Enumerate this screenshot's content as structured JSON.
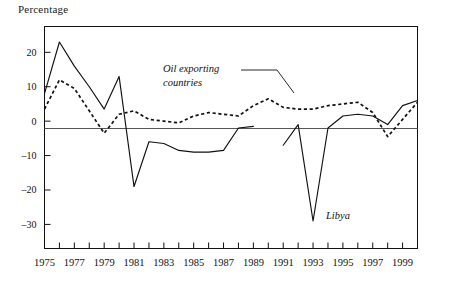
{
  "chart_data": {
    "type": "line",
    "title": "",
    "ylabel": "Percentage",
    "xlabel": "",
    "ylim": [
      -37,
      27.5
    ],
    "xlim": [
      1975,
      2000
    ],
    "grid": false,
    "zero_line": true,
    "legend_position": "inline-annotations",
    "y_ticks": [
      20,
      10,
      0,
      -10,
      -20,
      -30
    ],
    "y_tick_labels": [
      "20",
      "10",
      "0",
      "–10",
      "–20",
      "–30"
    ],
    "x_ticks": [
      1975,
      1976,
      1977,
      1978,
      1979,
      1980,
      1981,
      1982,
      1983,
      1984,
      1985,
      1986,
      1987,
      1988,
      1989,
      1990,
      1991,
      1992,
      1993,
      1994,
      1995,
      1996,
      1997,
      1998,
      1999,
      2000
    ],
    "x_tick_labels_shown": [
      "1975",
      "1977",
      "1979",
      "1981",
      "1983",
      "1985",
      "1987",
      "1989",
      "1991",
      "1993",
      "1995",
      "1997",
      "1999"
    ],
    "x": [
      1975,
      1976,
      1977,
      1978,
      1979,
      1980,
      1981,
      1982,
      1983,
      1984,
      1985,
      1986,
      1987,
      1988,
      1989,
      1990,
      1991,
      1992,
      1993,
      1994,
      1995,
      1996,
      1997,
      1998,
      1999,
      2000
    ],
    "series": [
      {
        "name": "Libya",
        "style": "solid",
        "color": "#111111",
        "annotation": "Libya",
        "has_gap": true,
        "gap_between": [
          1989,
          1991
        ],
        "values": [
          8.0,
          23.0,
          16.0,
          10.0,
          3.5,
          13.0,
          -19.0,
          -6.0,
          -6.5,
          -8.5,
          -9.0,
          -9.0,
          -8.5,
          -2.0,
          -1.5,
          null,
          -7.0,
          -1.0,
          -29.0,
          -2.0,
          1.5,
          2.0,
          1.5,
          -1.0,
          4.5,
          6.0
        ]
      },
      {
        "name": "Oil exporting countries",
        "style": "dashed",
        "color": "#111111",
        "annotation": "Oil exporting\ncountries",
        "annotation_line1": "Oil exporting",
        "annotation_line2": "countries",
        "has_gap": false,
        "values": [
          3.5,
          12.0,
          9.5,
          3.0,
          -3.5,
          2.0,
          3.0,
          0.5,
          0.0,
          -0.5,
          1.5,
          2.5,
          2.0,
          1.5,
          4.5,
          6.5,
          4.0,
          3.5,
          3.5,
          4.5,
          5.0,
          5.5,
          2.5,
          -4.5,
          0.5,
          5.5
        ]
      }
    ]
  },
  "annotations": {
    "oil_label_line1": "Oil exporting",
    "oil_label_line2": "countries",
    "libya_label": "Libya"
  },
  "axis": {
    "y_title": "Percentage"
  }
}
